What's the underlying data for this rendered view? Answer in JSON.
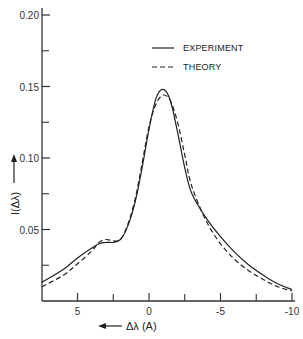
{
  "chart_data": {
    "type": "line",
    "title": "",
    "xlabel": "Δλ (A)",
    "ylabel": "I(Δλ)",
    "x_axis_reversed": true,
    "xlim": [
      7.5,
      -10
    ],
    "ylim": [
      0,
      0.2
    ],
    "x_ticks": [
      5,
      0,
      -5,
      -10
    ],
    "x_tick_labels": [
      "5",
      "0",
      "-5",
      "-10"
    ],
    "x_minor_ticks": [
      2.5,
      -2.5,
      -7.5
    ],
    "y_ticks": [
      0.05,
      0.1,
      0.15,
      0.2
    ],
    "y_tick_labels": [
      "0.05",
      "0.10",
      "0.15",
      "0.20"
    ],
    "y_minor_ticks": [
      0.025,
      0.075,
      0.125,
      0.175
    ],
    "grid": false,
    "legend_position": "upper right",
    "series": [
      {
        "name": "EXPERIMENT",
        "style": "solid",
        "x": [
          7.5,
          6,
          5,
          4,
          3.5,
          3,
          2.5,
          2,
          1.5,
          1,
          0.5,
          0,
          -0.5,
          -1,
          -1.5,
          -2,
          -2.5,
          -3,
          -4,
          -5,
          -6,
          -7,
          -8,
          -9,
          -10
        ],
        "y": [
          0.013,
          0.022,
          0.03,
          0.037,
          0.04,
          0.041,
          0.041,
          0.043,
          0.052,
          0.068,
          0.092,
          0.12,
          0.142,
          0.148,
          0.14,
          0.118,
          0.093,
          0.075,
          0.058,
          0.045,
          0.034,
          0.025,
          0.018,
          0.012,
          0.008
        ]
      },
      {
        "name": "THEORY",
        "style": "dashed",
        "x": [
          7.5,
          6,
          5,
          4,
          3.5,
          3,
          2.5,
          2,
          1.5,
          1,
          0.5,
          0,
          -0.5,
          -1,
          -1.5,
          -2,
          -2.5,
          -3,
          -4,
          -5,
          -6,
          -7,
          -8,
          -9,
          -10
        ],
        "y": [
          0.01,
          0.018,
          0.026,
          0.035,
          0.041,
          0.043,
          0.042,
          0.043,
          0.053,
          0.07,
          0.095,
          0.122,
          0.138,
          0.144,
          0.14,
          0.125,
          0.102,
          0.08,
          0.056,
          0.04,
          0.029,
          0.021,
          0.015,
          0.01,
          0.007
        ]
      }
    ]
  },
  "legend": {
    "items": [
      {
        "label": "EXPERIMENT",
        "style": "solid"
      },
      {
        "label": "THEORY",
        "style": "dashed"
      }
    ]
  },
  "axes": {
    "xlabel": "Δλ (A)",
    "ylabel": "I(Δλ)",
    "x_tick_labels": [
      "5",
      "0",
      "-5",
      "-10"
    ],
    "y_tick_labels": [
      "0.05",
      "0.10",
      "0.15",
      "0.20"
    ]
  },
  "colors": {
    "line": "#222222",
    "axis": "#333333",
    "background": "#ffffff"
  }
}
